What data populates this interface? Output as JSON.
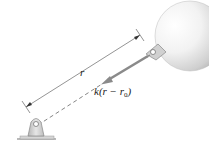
{
  "diagram": {
    "labels": {
      "distance": "r",
      "force_prefix": "k(r − r",
      "force_subscript": "0",
      "force_suffix": ")"
    },
    "elements": {
      "sphere": "sphere-body",
      "ground_support": "pinned-bracket",
      "spring_line": "dashed-line",
      "force_arrow": "force-vector",
      "dimension_line": "length-dimension"
    },
    "colors": {
      "arrow": "#8a8a8a",
      "dimension": "#555555",
      "support": "#c8c8c8",
      "sphere_light": "#ffffff",
      "sphere_dark": "#b0b0b0",
      "text": "#222222"
    }
  }
}
